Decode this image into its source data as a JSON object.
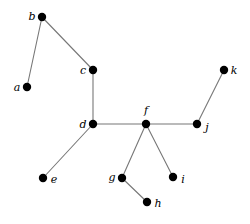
{
  "figure": {
    "type": "node-link-graph",
    "width": 250,
    "height": 224,
    "background_color": "#ffffff",
    "edge_color": "#777777",
    "node_color": "#000000",
    "label_color": "#000000",
    "node_radius": 4.2,
    "edge_width": 1.1
  },
  "graph": {
    "nodes": [
      {
        "id": "a",
        "label": "a",
        "x": 27,
        "y": 87,
        "label_x": 17,
        "label_y": 87
      },
      {
        "id": "b",
        "label": "b",
        "x": 42,
        "y": 17,
        "label_x": 32,
        "label_y": 16
      },
      {
        "id": "c",
        "label": "c",
        "x": 93,
        "y": 70,
        "label_x": 83,
        "label_y": 70
      },
      {
        "id": "d",
        "label": "d",
        "x": 93,
        "y": 124,
        "label_x": 83,
        "label_y": 124
      },
      {
        "id": "e",
        "label": "e",
        "x": 43,
        "y": 178,
        "label_x": 54,
        "label_y": 179
      },
      {
        "id": "f",
        "label": "f",
        "x": 146,
        "y": 124,
        "label_x": 146,
        "label_y": 110
      },
      {
        "id": "g",
        "label": "g",
        "x": 122,
        "y": 178,
        "label_x": 112,
        "label_y": 177
      },
      {
        "id": "h",
        "label": "h",
        "x": 147,
        "y": 202,
        "label_x": 158,
        "label_y": 203
      },
      {
        "id": "i",
        "label": "i",
        "x": 173,
        "y": 177,
        "label_x": 183,
        "label_y": 179
      },
      {
        "id": "j",
        "label": "j",
        "x": 197,
        "y": 124,
        "label_x": 207,
        "label_y": 127
      },
      {
        "id": "k",
        "label": "k",
        "x": 224,
        "y": 70,
        "label_x": 234,
        "label_y": 70
      }
    ],
    "edges": [
      {
        "source": "a",
        "target": "b"
      },
      {
        "source": "b",
        "target": "c"
      },
      {
        "source": "c",
        "target": "d"
      },
      {
        "source": "d",
        "target": "e"
      },
      {
        "source": "d",
        "target": "f"
      },
      {
        "source": "f",
        "target": "g"
      },
      {
        "source": "f",
        "target": "i"
      },
      {
        "source": "f",
        "target": "j"
      },
      {
        "source": "g",
        "target": "h"
      },
      {
        "source": "j",
        "target": "k"
      }
    ]
  }
}
